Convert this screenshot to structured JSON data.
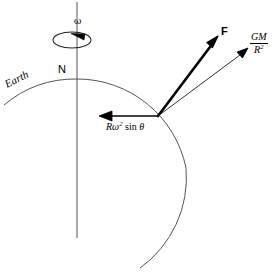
{
  "figure": {
    "background_color": "#ffffff",
    "line_color": "#000000",
    "thin_line_color": "#555555"
  },
  "labels": {
    "omega": "ω",
    "north_pole": "N",
    "earth": "Earth",
    "force_resultant": "F",
    "gravity_numerator": "GM",
    "gravity_denominator_base": "R",
    "gravity_denominator_exponent": "2",
    "centrifugal_prefix": "Rω",
    "centrifugal_exponent": "2",
    "centrifugal_suffix": " sin ",
    "centrifugal_angle": "θ"
  },
  "geometry": {
    "axis_x": 77,
    "axis_top_y": 2,
    "axis_bottom_y": 238,
    "spin_ellipse_cx": 72,
    "spin_ellipse_cy": 40,
    "spin_ellipse_rx": 19,
    "spin_ellipse_ry": 8,
    "earth_center_x": 77,
    "earth_center_y": 190,
    "earth_radius": 111,
    "vertex_x": 158,
    "vertex_y": 116,
    "force_tip_x": 218,
    "force_tip_y": 37,
    "gravity_tip_x": 248,
    "gravity_tip_y": 48,
    "centrifugal_tip_x": 100,
    "centrifugal_tip_y": 116
  }
}
